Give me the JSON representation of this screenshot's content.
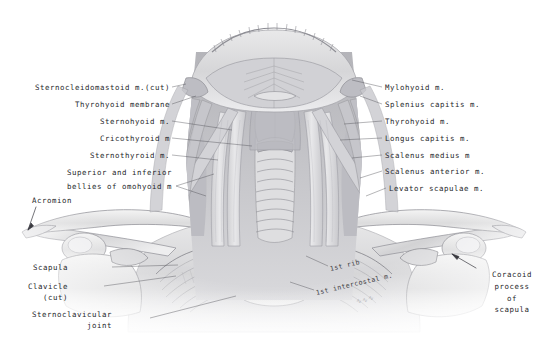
{
  "plate": {
    "title": "Anterior neck and shoulder girdle dissection",
    "background_color": "#ffffff",
    "ink_color": "#26262a"
  },
  "labels_left": [
    {
      "text": "Sternocleidomastoid m.(cut)",
      "x": 170,
      "y": 89
    },
    {
      "text": "Thyrohyoid membrane",
      "x": 170,
      "y": 106
    },
    {
      "text": "Sternohyoid m.",
      "x": 170,
      "y": 123
    },
    {
      "text": "Cricothyroid m",
      "x": 170,
      "y": 140
    },
    {
      "text": "Sternothyroid m.",
      "x": 170,
      "y": 157
    },
    {
      "text": "Superior and inferior",
      "x": 172,
      "y": 174
    },
    {
      "text": "bellies of omohyoid m",
      "x": 172,
      "y": 188
    },
    {
      "text": "Acromion",
      "x": 72,
      "y": 202
    },
    {
      "text": "Scapula",
      "x": 68,
      "y": 269
    },
    {
      "text": "Clavicle",
      "x": 68,
      "y": 288
    },
    {
      "text": "(cut)",
      "x": 68,
      "y": 299
    },
    {
      "text": "Sternoclavicular",
      "x": 112,
      "y": 316
    },
    {
      "text": "joint",
      "x": 112,
      "y": 327
    }
  ],
  "labels_right": [
    {
      "text": "Mylohyoid m.",
      "x": 385,
      "y": 89
    },
    {
      "text": "Splenius capitis m.",
      "x": 385,
      "y": 106
    },
    {
      "text": "Thyrohyoid m.",
      "x": 385,
      "y": 123
    },
    {
      "text": "Longus capitis m.",
      "x": 385,
      "y": 140
    },
    {
      "text": "Scalenus medius m",
      "x": 385,
      "y": 157
    },
    {
      "text": "Scalenus anterior m.",
      "x": 385,
      "y": 173
    },
    {
      "text": "Levator scapulae m.",
      "x": 389,
      "y": 190
    }
  ],
  "labels_right_block": [
    {
      "text": "Coracoid",
      "x": 512,
      "y": 276
    },
    {
      "text": "process",
      "x": 512,
      "y": 288
    },
    {
      "text": "of scapula",
      "x": 512,
      "y": 300
    }
  ],
  "labels_in_art": [
    {
      "text": "1st rib",
      "x": 330,
      "y": 271,
      "rotate": -13
    },
    {
      "text": "1st intercostal m.",
      "x": 316,
      "y": 295,
      "rotate": -13
    }
  ],
  "signature": {
    "text": "illegible artist signature",
    "x": 356,
    "y": 303
  },
  "icons": {
    "acromion_pointer": "arrow-icon",
    "coracoid_pointer": "arrow-icon"
  }
}
